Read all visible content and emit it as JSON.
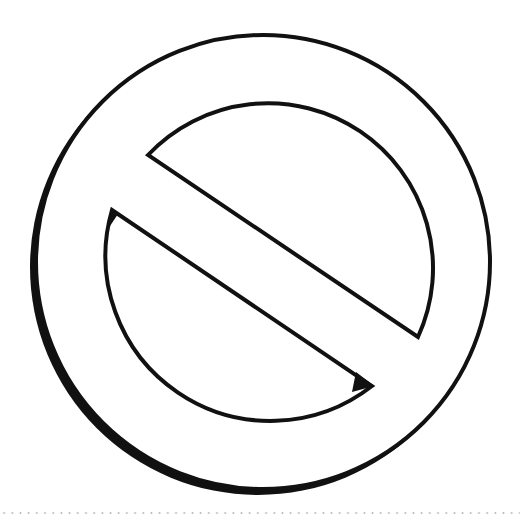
{
  "symbol": {
    "name": "prohibition sign",
    "stroke_color": "#111111",
    "fill_color": "#ffffff",
    "shadow_color": "#111111"
  },
  "footer": {
    "divider_style": "dotted",
    "divider_color": "#b8b8b8"
  }
}
